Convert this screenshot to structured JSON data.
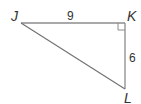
{
  "diagram": {
    "type": "right-triangle",
    "vertices": [
      {
        "label": "J",
        "x": 21,
        "y": 23
      },
      {
        "label": "K",
        "x": 125,
        "y": 23
      },
      {
        "label": "L",
        "x": 125,
        "y": 89
      }
    ],
    "right_angle_at": "K",
    "sides": [
      {
        "between": "JK",
        "label": "9"
      },
      {
        "between": "KL",
        "label": "6"
      },
      {
        "between": "JL",
        "label": ""
      }
    ],
    "colors": {
      "line": "#8c8c8c",
      "text": "#333333",
      "background": "#ffffff"
    }
  }
}
